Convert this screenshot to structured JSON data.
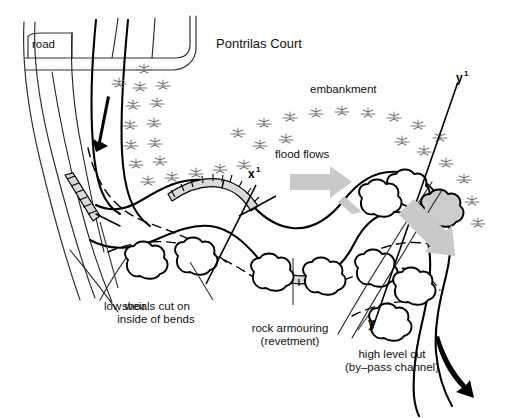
{
  "diagram": {
    "title": "Pontrilas Court",
    "background_color": "#ffffff",
    "ink_color": "#000000",
    "flood_arrow_color": "#c9c9c9",
    "vegetation_color": "#777777",
    "labels": {
      "road": "road",
      "title": "Pontrilas Court",
      "embankment": "embankment",
      "flood_flows": "flood flows",
      "low_weir": "low weir",
      "shoals_line1": "shoals cut on",
      "shoals_line2": "inside of bends",
      "rock_armouring_line1": "rock armouring",
      "rock_armouring_line2": "(revetment)",
      "high_level_cut_line1": "high level cut",
      "high_level_cut_line2": "(by–pass channel)"
    },
    "section_markers": {
      "x_top": "x",
      "x_top_sup": "1",
      "y_top": "y",
      "y_top_sup": "1",
      "y_bottom": "y"
    },
    "features": [
      "road corridor",
      "river channel with meanders",
      "flood embankment with scrub",
      "low weir",
      "shoals cut on inside of bends",
      "rock armouring (revetment) on outer bends",
      "high level cut (by-pass channel)",
      "flood flow arrows",
      "section lines x-x1 and y-y1"
    ]
  }
}
